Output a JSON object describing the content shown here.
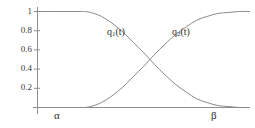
{
  "chart_data": {
    "type": "line",
    "title": "",
    "xlabel": "",
    "ylabel": "",
    "xlim": [
      0,
      1
    ],
    "ylim": [
      0,
      1
    ],
    "grid": false,
    "legend_position": "inline-annotations",
    "y_ticks": [
      "1",
      "0.8",
      "0.6",
      "0.4",
      "0.2"
    ],
    "y_tick_values": [
      1,
      0.8,
      0.6,
      0.4,
      0.2
    ],
    "x_ticks": [
      "α",
      "β"
    ],
    "x_tick_values": [
      0.22,
      0.97
    ],
    "annotations": [
      {
        "text": "q₁(t)",
        "x": 0.55,
        "y": 0.78
      },
      {
        "text": "q₂(t)",
        "x": 0.92,
        "y": 0.78
      }
    ],
    "crossing_point": {
      "x": 0.565,
      "y": 0.5
    },
    "series": [
      {
        "name": "q₁(t)",
        "label_base": "q",
        "label_sub": "1",
        "label_suffix": "(t)",
        "color": "#8a8a8a",
        "description": "decreasing smoothstep from 1 to 0 between alpha and beta",
        "x": [
          0.0,
          0.05,
          0.1,
          0.15,
          0.2,
          0.22,
          0.25,
          0.3,
          0.35,
          0.4,
          0.45,
          0.5,
          0.55,
          0.6,
          0.65,
          0.7,
          0.75,
          0.8,
          0.85,
          0.9,
          0.95,
          1.0
        ],
        "values": [
          1.0,
          1.0,
          1.0,
          1.0,
          1.0,
          1.0,
          0.99,
          0.95,
          0.88,
          0.79,
          0.68,
          0.57,
          0.45,
          0.34,
          0.24,
          0.16,
          0.09,
          0.05,
          0.02,
          0.01,
          0.0,
          0.0
        ]
      },
      {
        "name": "q₂(t)",
        "label_base": "q",
        "label_sub": "2",
        "label_suffix": "(t)",
        "color": "#8a8a8a",
        "description": "increasing smoothstep from 0 to 1 between alpha and beta",
        "x": [
          0.0,
          0.05,
          0.1,
          0.15,
          0.2,
          0.22,
          0.25,
          0.3,
          0.35,
          0.4,
          0.45,
          0.5,
          0.55,
          0.6,
          0.65,
          0.7,
          0.75,
          0.8,
          0.85,
          0.9,
          0.95,
          1.0
        ],
        "values": [
          0.0,
          0.0,
          0.0,
          0.0,
          0.0,
          0.0,
          0.01,
          0.05,
          0.12,
          0.21,
          0.32,
          0.43,
          0.55,
          0.66,
          0.76,
          0.84,
          0.91,
          0.95,
          0.98,
          0.99,
          1.0,
          1.0
        ]
      }
    ]
  },
  "axis": {
    "y_label_1": "1",
    "y_label_08": "0.8",
    "y_label_06": "0.6",
    "y_label_04": "0.4",
    "y_label_02": "0.2",
    "x_label_alpha": "α",
    "x_label_beta": "β",
    "axis_color": "#8f8f8f"
  },
  "curves": {
    "q1_base": "q",
    "q1_sub": "1",
    "q1_suffix": "(t)",
    "q2_base": "q",
    "q2_sub": "2",
    "q2_suffix": "(t)",
    "curve_color": "#8a8a8a"
  }
}
